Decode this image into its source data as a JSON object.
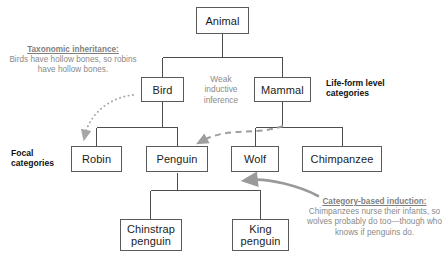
{
  "diagram": {
    "nodes": {
      "animal": "Animal",
      "bird": "Bird",
      "mammal": "Mammal",
      "robin": "Robin",
      "penguin": "Penguin",
      "wolf": "Wolf",
      "chimpanzee": "Chimpanzee",
      "chinstrap_line1": "Chinstrap",
      "chinstrap_line2": "penguin",
      "king_line1": "King",
      "king_line2": "penguin"
    },
    "labels": {
      "focal_line1": "Focal",
      "focal_line2": "categories",
      "lifeform_line1": "Life-form level",
      "lifeform_line2": "categories"
    },
    "annotations": {
      "taxonomic": {
        "heading": "Taxonomic inheritance:",
        "body": "Birds have hollow bones, so robins have hollow bones."
      },
      "weak": {
        "line1": "Weak",
        "line2": "inductive",
        "line3": "inference"
      },
      "category_based": {
        "heading": "Category-based induction:",
        "body": "Chimpanzees nurse their infants, so wolves probably do too—though who knows if penguins do."
      }
    },
    "colors": {
      "box_border": "#5a5a5a",
      "box_text": "#1c1c1c",
      "connector": "#4d4d4d",
      "annotation_text": "#8a8a8a",
      "arrow_gray": "#9a9a9a",
      "label_text": "#111111",
      "background": "#ffffff"
    }
  }
}
